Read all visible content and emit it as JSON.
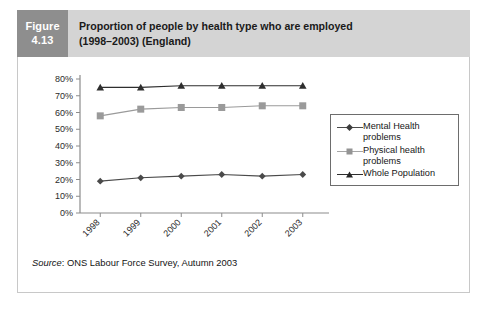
{
  "figure": {
    "number_line1": "Figure",
    "number_line2": "4.13",
    "title_line1": "Proportion of people by health type who are employed",
    "title_line2": "(1998–2003) (England)",
    "number_box_color": "#8e8e8e",
    "title_box_color": "#d4d4d4"
  },
  "source": {
    "label": "Source",
    "text": ": ONS Labour Force Survey, Autumn 2003"
  },
  "legend": {
    "items": [
      {
        "label": "Mental Health\nproblems",
        "color": "#4a4a4a",
        "marker": "diamond"
      },
      {
        "label": "Physical health\nproblems",
        "color": "#9a9a9a",
        "marker": "square"
      },
      {
        "label": "Whole Population",
        "color": "#2e2e2e",
        "marker": "triangle"
      }
    ]
  },
  "axis": {
    "y_ticks": [
      "0%",
      "10%",
      "20%",
      "30%",
      "40%",
      "50%",
      "60%",
      "70%",
      "80%"
    ],
    "x_ticks": [
      "1998",
      "1999",
      "2000",
      "2001",
      "2002",
      "2003"
    ]
  },
  "chart_data": {
    "type": "line",
    "title": "Proportion of people by health type who are employed (1998–2003) (England)",
    "xlabel": "",
    "ylabel": "",
    "categories": [
      "1998",
      "1999",
      "2000",
      "2001",
      "2002",
      "2003"
    ],
    "ylim": [
      0,
      80
    ],
    "ytick_step": 10,
    "ytick_format": "percent",
    "grid": false,
    "legend_position": "right",
    "series": [
      {
        "name": "Mental Health problems",
        "values": [
          19,
          21,
          22,
          23,
          22,
          23
        ],
        "color": "#4a4a4a",
        "marker": "diamond"
      },
      {
        "name": "Physical health problems",
        "values": [
          58,
          62,
          63,
          63,
          64,
          64
        ],
        "color": "#9a9a9a",
        "marker": "square"
      },
      {
        "name": "Whole Population",
        "values": [
          75,
          75,
          76,
          76,
          76,
          76
        ],
        "color": "#2e2e2e",
        "marker": "triangle"
      }
    ]
  }
}
